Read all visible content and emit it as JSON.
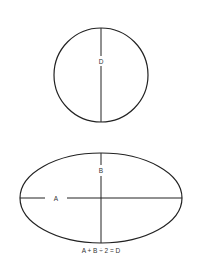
{
  "diagram": {
    "colors": {
      "stroke": "#222222",
      "background": "#ffffff",
      "text": "#333333"
    },
    "circle": {
      "label": "D",
      "cx": 101,
      "cy": 75,
      "r": 47
    },
    "ellipse": {
      "cx": 101,
      "cy": 198,
      "rx": 81,
      "ry": 45,
      "horizontal_axis_label": "A",
      "vertical_axis_label": "B"
    },
    "formula": "A + B ÷ 2 = D"
  }
}
